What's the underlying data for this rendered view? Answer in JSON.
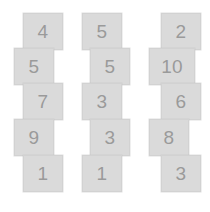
{
  "canvas": {
    "width": 210,
    "height": 212,
    "background_color": "#ffffff",
    "tile_fill_color": "#dadada",
    "tile_border_color": "#d2d2d2",
    "digit_color": "#9a9a9a"
  },
  "columns": [
    {
      "name": "column-1",
      "tiles": [
        {
          "value": "4",
          "x": 23,
          "y": 13,
          "wide": false
        },
        {
          "value": "5",
          "x": 14,
          "y": 48,
          "wide": false
        },
        {
          "value": "7",
          "x": 23,
          "y": 83,
          "wide": false
        },
        {
          "value": "9",
          "x": 14,
          "y": 119,
          "wide": false
        },
        {
          "value": "1",
          "x": 23,
          "y": 155,
          "wide": false
        }
      ]
    },
    {
      "name": "column-2",
      "tiles": [
        {
          "value": "5",
          "x": 14,
          "y": 13,
          "wide": false
        },
        {
          "value": "5",
          "x": 22,
          "y": 48,
          "wide": false
        },
        {
          "value": "3",
          "x": 14,
          "y": 83,
          "wide": false
        },
        {
          "value": "3",
          "x": 22,
          "y": 119,
          "wide": false
        },
        {
          "value": "1",
          "x": 14,
          "y": 155,
          "wide": false
        }
      ]
    },
    {
      "name": "column-3",
      "tiles": [
        {
          "value": "2",
          "x": 23,
          "y": 13,
          "wide": false
        },
        {
          "value": "10",
          "x": 11,
          "y": 48,
          "wide": true
        },
        {
          "value": "6",
          "x": 23,
          "y": 83,
          "wide": false
        },
        {
          "value": "8",
          "x": 11,
          "y": 119,
          "wide": false
        },
        {
          "value": "3",
          "x": 23,
          "y": 155,
          "wide": false
        }
      ]
    }
  ]
}
